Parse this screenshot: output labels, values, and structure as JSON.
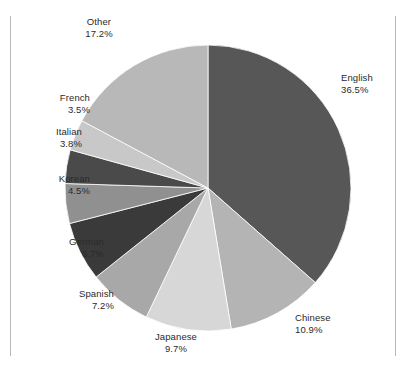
{
  "figure": {
    "background_color": "#ffffff",
    "frame_rule_color": "#b9b9b9",
    "label_text_color": "#2b2b2b"
  },
  "chart_data": {
    "type": "pie",
    "title": "",
    "subtitle": "",
    "xlabel": "",
    "ylabel": "",
    "legend_position": "none",
    "grid": false,
    "labels_outside": true,
    "label_format": "name + percent",
    "start_angle_deg": 0,
    "direction": "clockwise",
    "categories": [
      "English",
      "Chinese",
      "Japanese",
      "Spanish",
      "German",
      "Korean",
      "Italian",
      "French",
      "Other"
    ],
    "values": [
      36.5,
      10.9,
      9.7,
      7.2,
      6.7,
      4.5,
      3.8,
      3.5,
      17.2
    ],
    "value_labels": [
      "36.5%",
      "10.9%",
      "9.7%",
      "7.2%",
      "6.7%",
      "4.5%",
      "3.8%",
      "3.5%",
      "17.2%"
    ],
    "colors": [
      "#575757",
      "#b4b4b4",
      "#d7d7d7",
      "#a8a8a8",
      "#3a3a3a",
      "#909090",
      "#4a4a4a",
      "#c8c8c8",
      "#b8b8b8"
    ],
    "total": 100.0,
    "slices": [
      {
        "name": "English",
        "value": 36.5,
        "value_label": "36.5%",
        "color": "#575757",
        "label_align": "left"
      },
      {
        "name": "Chinese",
        "value": 10.9,
        "value_label": "10.9%",
        "color": "#b4b4b4",
        "label_align": "left"
      },
      {
        "name": "Japanese",
        "value": 9.7,
        "value_label": "9.7%",
        "color": "#d7d7d7",
        "label_align": "center"
      },
      {
        "name": "Spanish",
        "value": 7.2,
        "value_label": "7.2%",
        "color": "#a8a8a8",
        "label_align": "right"
      },
      {
        "name": "German",
        "value": 6.7,
        "value_label": "6.7%",
        "color": "#3a3a3a",
        "label_align": "right"
      },
      {
        "name": "Korean",
        "value": 4.5,
        "value_label": "4.5%",
        "color": "#909090",
        "label_align": "right"
      },
      {
        "name": "Italian",
        "value": 3.8,
        "value_label": "3.8%",
        "color": "#4a4a4a",
        "label_align": "right"
      },
      {
        "name": "French",
        "value": 3.5,
        "value_label": "3.5%",
        "color": "#c8c8c8",
        "label_align": "right"
      },
      {
        "name": "Other",
        "value": 17.2,
        "value_label": "17.2%",
        "color": "#b8b8b8",
        "label_align": "center"
      }
    ],
    "geometry": {
      "center_x": 208,
      "center_y": 188,
      "radius": 143
    }
  }
}
